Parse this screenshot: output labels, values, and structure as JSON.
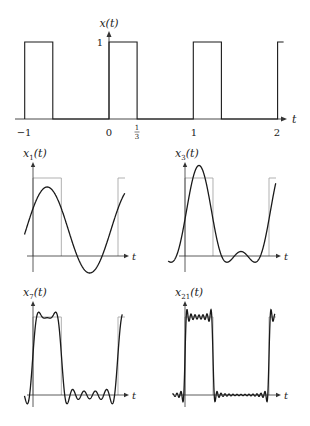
{
  "figure": {
    "top_plot": {
      "ylabel": "x(t)",
      "xlabel": "t",
      "y_tick_label": "1",
      "x_ticks": [
        {
          "value": -1,
          "label": "−1"
        },
        {
          "value": 0,
          "label": "0"
        },
        {
          "value": 0.3333,
          "label_num": "1",
          "label_den": "3"
        },
        {
          "value": 1,
          "label": "1"
        },
        {
          "value": 2,
          "label": "2"
        }
      ],
      "signal": {
        "period": 1,
        "high_duration": 0.3333,
        "amplitude": 1
      }
    },
    "panels": [
      {
        "name": "x1",
        "ylabel_base": "x",
        "ylabel_sub": "1",
        "ylabel_tail": "(t)",
        "xlabel": "t",
        "N": 1
      },
      {
        "name": "x3",
        "ylabel_base": "x",
        "ylabel_sub": "3",
        "ylabel_tail": "(t)",
        "xlabel": "t",
        "N": 3
      },
      {
        "name": "x7",
        "ylabel_base": "x",
        "ylabel_sub": "7",
        "ylabel_tail": "(t)",
        "xlabel": "t",
        "N": 7
      },
      {
        "name": "x21",
        "ylabel_base": "x",
        "ylabel_sub": "21",
        "ylabel_tail": "(t)",
        "xlabel": "t",
        "N": 21
      }
    ],
    "colors": {
      "curve": "#1a1a1a",
      "square_overlay": "#a8a8a8",
      "axis": "#333333"
    }
  }
}
